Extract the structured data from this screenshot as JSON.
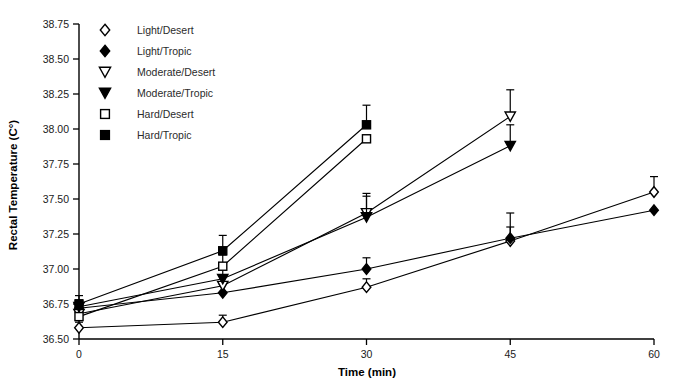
{
  "chart_data": {
    "type": "line",
    "title": "",
    "xlabel": "Time (min)",
    "ylabel": "Rectal Temperature (C°)",
    "xlim": [
      0,
      60
    ],
    "ylim": [
      36.5,
      38.75
    ],
    "xticks": [
      0,
      15,
      30,
      45,
      60
    ],
    "xtick_labels": [
      "0",
      "15",
      "30",
      "45",
      "60"
    ],
    "yticks": [
      36.5,
      36.75,
      37.0,
      37.25,
      37.5,
      37.75,
      38.0,
      38.25,
      38.5,
      38.75
    ],
    "ytick_labels": [
      "36.50",
      "36.75",
      "37.00",
      "37.25",
      "37.50",
      "37.75",
      "38.00",
      "38.25",
      "38.50",
      "38.75"
    ],
    "grid": false,
    "legend_position": "top-left",
    "error_bars": "upper-only",
    "series": [
      {
        "name": "Light/Desert",
        "marker": "open-diamond",
        "x": [
          0,
          15,
          30,
          45,
          60
        ],
        "values": [
          36.58,
          36.62,
          36.87,
          37.2,
          37.55
        ],
        "errors": [
          0.04,
          0.05,
          0.06,
          0.1,
          0.11
        ]
      },
      {
        "name": "Light/Tropic",
        "marker": "filled-diamond",
        "x": [
          0,
          15,
          30,
          45,
          60
        ],
        "values": [
          36.72,
          36.83,
          37.0,
          37.22,
          37.42
        ],
        "errors": [
          0.05,
          0.06,
          0.08,
          0.18,
          0.0
        ]
      },
      {
        "name": "Moderate/Desert",
        "marker": "open-triangle-down",
        "x": [
          0,
          15,
          30,
          45
        ],
        "values": [
          36.68,
          36.88,
          37.4,
          38.09
        ],
        "errors": [
          0.05,
          0.07,
          0.14,
          0.19
        ]
      },
      {
        "name": "Moderate/Tropic",
        "marker": "filled-triangle-down",
        "x": [
          0,
          15,
          30,
          45
        ],
        "values": [
          36.73,
          36.93,
          37.37,
          37.88
        ],
        "errors": [
          0.05,
          0.08,
          0.15,
          0.15
        ]
      },
      {
        "name": "Hard/Desert",
        "marker": "open-square",
        "x": [
          0,
          15,
          30
        ],
        "values": [
          36.66,
          37.02,
          37.93
        ],
        "errors": [
          0.05,
          0.08,
          0.0
        ]
      },
      {
        "name": "Hard/Tropic",
        "marker": "filled-square",
        "x": [
          0,
          15,
          30
        ],
        "values": [
          36.75,
          37.13,
          38.03
        ],
        "errors": [
          0.06,
          0.11,
          0.14
        ]
      }
    ]
  },
  "legend": {
    "items": [
      {
        "label": "Light/Desert",
        "marker": "open-diamond"
      },
      {
        "label": "Light/Tropic",
        "marker": "filled-diamond"
      },
      {
        "label": "Moderate/Desert",
        "marker": "open-triangle-down"
      },
      {
        "label": "Moderate/Tropic",
        "marker": "filled-triangle-down"
      },
      {
        "label": "Hard/Desert",
        "marker": "open-square"
      },
      {
        "label": "Hard/Tropic",
        "marker": "filled-square"
      }
    ]
  },
  "colors": {
    "ink": "#000000",
    "background": "#ffffff",
    "tick_text": "#1a1a1a",
    "legend_text": "#2b2b2b"
  }
}
